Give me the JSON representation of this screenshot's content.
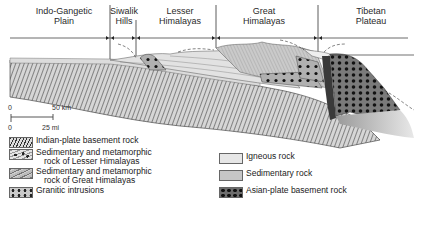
{
  "regions": [
    {
      "label_line1": "Indo-Gangetic",
      "label_line2": "Plain"
    },
    {
      "label_line1": "Siwalik",
      "label_line2": "Hills"
    },
    {
      "label_line1": "Lesser",
      "label_line2": "Himalayas"
    },
    {
      "label_line1": "Great",
      "label_line2": "Himalayas"
    },
    {
      "label_line1": "Tibetan",
      "label_line2": "Plateau"
    }
  ],
  "scale": {
    "km_start": "0",
    "km_end": "50 km",
    "mi_start": "0",
    "mi_end": "25 mi"
  },
  "legend": {
    "left": [
      {
        "label_line1": "Indian-plate basement rock",
        "label_line2": "",
        "pattern": "diagonal-hatch"
      },
      {
        "label_line1": "Sedimentary and metamorphic",
        "label_line2": "rock of Lesser Himalayas",
        "pattern": "dotted-hatch"
      },
      {
        "label_line1": "Sedimentary and metamorphic",
        "label_line2": "rock of Great Himalayas",
        "pattern": "fine-hatch"
      },
      {
        "label_line1": "Granitic intrusions",
        "label_line2": "",
        "pattern": "crosses"
      }
    ],
    "right": [
      {
        "label": "Igneous rock",
        "color": "#e6e6e6"
      },
      {
        "label": "Sedimentary rock",
        "color": "#c6c6c6"
      },
      {
        "label": "Asian-plate basement rock",
        "color": "#6d6d6d"
      }
    ]
  },
  "colors": {
    "indian_plate": "#d0d0d0",
    "lesser": "#e0e0e0",
    "great": "#bdbdbd",
    "asian": "#8a8a8a",
    "lines": "#333333"
  }
}
